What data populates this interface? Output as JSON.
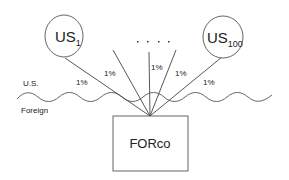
{
  "diagram": {
    "nodes": {
      "us_first": {
        "label": "US",
        "subscript": "1"
      },
      "us_last": {
        "label": "US",
        "subscript": "100"
      },
      "ellipsis": ". . . .",
      "forco": {
        "label": "FORco"
      }
    },
    "regions": {
      "upper": "U.S.",
      "lower": "Foreign"
    },
    "edges": [
      {
        "from": "us_first",
        "to": "forco",
        "label": "1%"
      },
      {
        "from": "us_2",
        "to": "forco",
        "label": "1%"
      },
      {
        "from": "us_mid",
        "to": "forco",
        "label": "1%"
      },
      {
        "from": "us_99",
        "to": "forco",
        "label": "1%"
      },
      {
        "from": "us_last",
        "to": "forco",
        "label": "1%"
      }
    ],
    "colors": {
      "stroke": "#555555",
      "text": "#222222",
      "background": "#ffffff"
    }
  }
}
